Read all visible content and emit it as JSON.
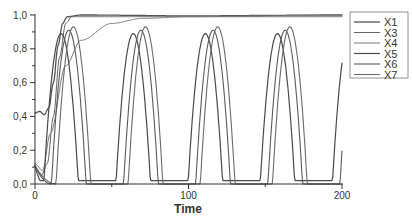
{
  "chart_data": {
    "type": "line",
    "title": "",
    "xlabel": "Time",
    "ylabel": "",
    "xlim": [
      0,
      200
    ],
    "ylim": [
      0.0,
      1.0
    ],
    "x_ticks": [
      "0",
      "100",
      "200"
    ],
    "x_minor_ticks": [
      50,
      150
    ],
    "y_ticks": [
      "0,0",
      "0,2",
      "0,4",
      "0,6",
      "0,8",
      "1,0"
    ],
    "grid": false,
    "legend_position": "top-right",
    "legend": [
      "X1",
      "X3",
      "X4",
      "X5",
      "X6",
      "X7"
    ],
    "series": [
      {
        "name": "X1",
        "color": "#555555",
        "width": 1.3,
        "kind": "sigmoid",
        "description": "starts ~0.42, small dip, rises to ~1.0 by t~20, stays ~1.0",
        "points": [
          [
            0,
            0.42
          ],
          [
            3,
            0.43
          ],
          [
            6,
            0.41
          ],
          [
            9,
            0.45
          ],
          [
            12,
            0.6
          ],
          [
            15,
            0.82
          ],
          [
            18,
            0.95
          ],
          [
            21,
            0.99
          ],
          [
            30,
            1.0
          ],
          [
            100,
            0.995
          ],
          [
            200,
            1.0
          ]
        ]
      },
      {
        "name": "X3",
        "color": "#666666",
        "width": 1.0,
        "kind": "sigmoid",
        "description": "rises to ~0.99 by t~22",
        "points": [
          [
            0,
            0.1
          ],
          [
            4,
            0.05
          ],
          [
            8,
            0.12
          ],
          [
            12,
            0.4
          ],
          [
            16,
            0.75
          ],
          [
            20,
            0.95
          ],
          [
            24,
            0.99
          ],
          [
            200,
            0.99
          ]
        ]
      },
      {
        "name": "X4",
        "color": "#777777",
        "width": 1.0,
        "kind": "saturating",
        "description": "rises slowly, saturates near 1.0 by t~70",
        "points": [
          [
            0,
            0.12
          ],
          [
            5,
            0.08
          ],
          [
            10,
            0.3
          ],
          [
            20,
            0.7
          ],
          [
            30,
            0.85
          ],
          [
            50,
            0.95
          ],
          [
            70,
            0.98
          ],
          [
            100,
            0.99
          ],
          [
            200,
            1.0
          ]
        ]
      },
      {
        "name": "X5",
        "color": "#4a4a4a",
        "width": 1.2,
        "kind": "oscillation",
        "peak": 0.89,
        "period": 47,
        "first_peak": 17,
        "min": 0.02
      },
      {
        "name": "X6",
        "color": "#5a5a5a",
        "width": 1.1,
        "kind": "oscillation",
        "peak": 0.91,
        "period": 47,
        "first_peak": 22,
        "min": 0.0
      },
      {
        "name": "X7",
        "color": "#6a6a6a",
        "width": 1.1,
        "kind": "oscillation",
        "peak": 0.93,
        "period": 47,
        "first_peak": 25,
        "min": 0.0
      }
    ]
  }
}
